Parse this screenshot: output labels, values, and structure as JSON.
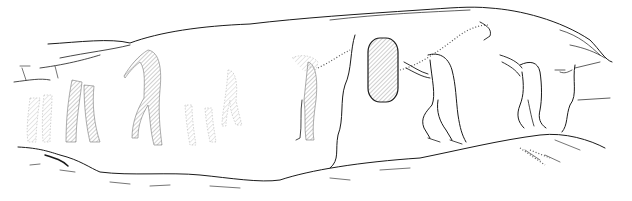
{
  "illustration": {
    "subject": "rock-art-line-drawing",
    "description": "Hand-drawn line illustration of a rock panel with petroglyph figures: faint hatched human/animal legs on the left, a tall hatched figure, a central hatched oval shield held by two figures connected by dotted lines, and a quadruped-like figure on the right",
    "colors": {
      "background": "#ffffff",
      "ink": "#1a1a1a",
      "hatch": "#777777"
    },
    "figures": [
      {
        "name": "left-legs-group",
        "x": 30,
        "y": 80
      },
      {
        "name": "tall-hatched-figure",
        "x": 140,
        "y": 50
      },
      {
        "name": "faint-legs-pair",
        "x": 190,
        "y": 105
      },
      {
        "name": "faint-small-figure",
        "x": 230,
        "y": 70
      },
      {
        "name": "left-standing-figure",
        "x": 300,
        "y": 55
      },
      {
        "name": "hatched-oval-shield",
        "x": 370,
        "y": 40
      },
      {
        "name": "bending-figure",
        "x": 420,
        "y": 50
      },
      {
        "name": "right-quadruped-figure",
        "x": 500,
        "y": 55
      }
    ]
  }
}
